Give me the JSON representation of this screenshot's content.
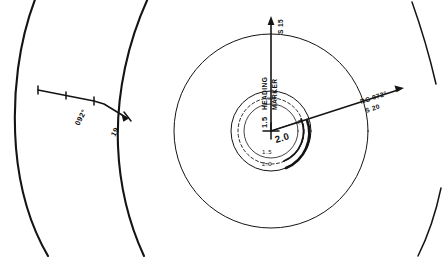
{
  "figure": {
    "ink_color": "#141414",
    "background_color": "#ffffff"
  },
  "left_panel": {
    "name": "range-arc-panel",
    "bearing_label": "092°",
    "distance_label": "19",
    "arcs": [
      {
        "id": "outer-range-arc",
        "weight": "heavy"
      },
      {
        "id": "inner-range-arc",
        "weight": "heavy"
      },
      {
        "id": "far-right-arc",
        "weight": "mid"
      }
    ],
    "vector": {
      "id": "relative-motion-line",
      "tick_count": 3,
      "has_arrow_head": true
    }
  },
  "right_panel": {
    "name": "polar-radar-display",
    "heading_marker_label_1": "HEADING",
    "heading_marker_label_2": "MARKER",
    "speed_label_top": "S 15",
    "course_label": "RC 072°",
    "course_speed_label": "S 20",
    "center_scale_vertical": "1.5",
    "center_scale_diagonal": "2.0",
    "ring_label_inner": "1.5",
    "ring_label_outer": "2.0",
    "small_marker_r": "r",
    "small_marker_m": "m",
    "rings": [
      {
        "id": "outer-range-ring",
        "radius": 97,
        "style": "solid-light"
      },
      {
        "id": "mid-range-ring",
        "radius": 40,
        "style": "solid-light"
      },
      {
        "id": "inner-dashed-ring",
        "radius": 33,
        "style": "dashed"
      },
      {
        "id": "innermost-ring",
        "radius": 27,
        "style": "solid-light"
      }
    ],
    "heading_line": {
      "id": "heading-marker-line",
      "bearing_deg": 0
    },
    "course_line": {
      "id": "reference-course-line",
      "bearing_deg": 72
    }
  }
}
